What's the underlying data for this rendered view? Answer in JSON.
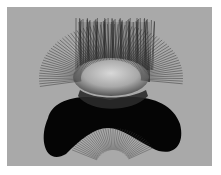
{
  "image": {
    "description": "Grayscale 3D rendering of a curved surface with radiating hair-like normal vectors",
    "background_color": "#ffffff",
    "frame_color": "#a9a9a9",
    "hair_color": "#1a1a1a",
    "body_color": "#050505",
    "highlight_color": "#cfcfcf"
  }
}
